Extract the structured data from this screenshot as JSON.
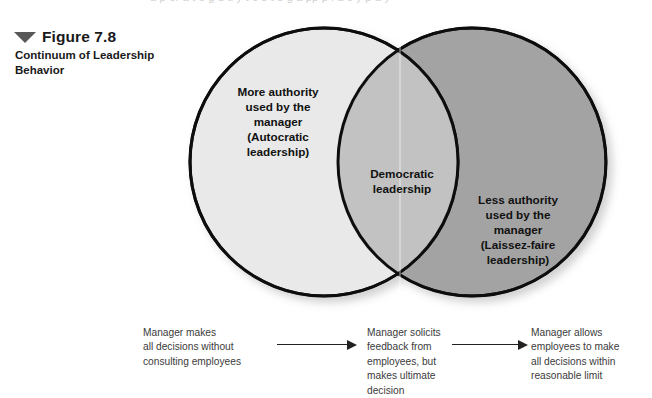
{
  "page": {
    "cutoff_text_top": "a p er a  t e  g   u  ti  y    t  e    s  t  e  g   a pp  p  i a  e   y  p  a  y"
  },
  "figure": {
    "marker_icon": "triangle-down-icon",
    "title": "Figure 7.8",
    "subtitle": "Continuum of Leadership Behavior"
  },
  "venn": {
    "left_circle": {
      "label": "More authority\nused by the\nmanager\n(Autocratic\nleadership)",
      "fill": "#e9e9e9",
      "stroke": "#111111"
    },
    "right_circle": {
      "label": "Less authority\nused by the\nmanager\n(Laissez-faire\nleadership)",
      "fill": "#a3a3a3",
      "stroke": "#111111"
    },
    "intersection": {
      "label": "Democratic\nleadership",
      "fill": "#c2c2c2"
    }
  },
  "continuum": {
    "steps": [
      {
        "text": "Manager makes\nall decisions without\nconsulting employees"
      },
      {
        "text": "Manager solicits\nfeedback from\nemployees, but\nmakes ultimate\ndecision"
      },
      {
        "text": "Manager allows\nemployees to make\nall decisions within\nreasonable limit"
      }
    ],
    "arrows": [
      {
        "name": "arrow-right-icon"
      },
      {
        "name": "arrow-right-icon"
      }
    ]
  }
}
